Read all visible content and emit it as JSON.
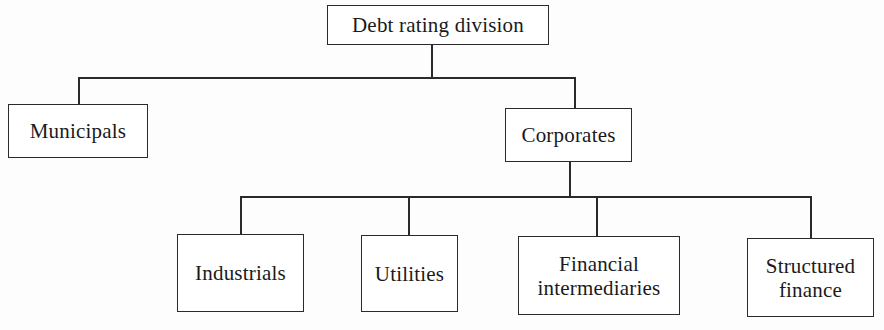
{
  "diagram": {
    "type": "org-chart",
    "root": {
      "label": "Debt rating division",
      "children": [
        {
          "label": "Municipals",
          "children": []
        },
        {
          "label": "Corporates",
          "children": [
            {
              "label": "Industrials"
            },
            {
              "label": "Utilities"
            },
            {
              "label": "Financial intermediaries",
              "lines": [
                "Financial",
                "intermediaries"
              ]
            },
            {
              "label": "Structured finance",
              "lines": [
                "Structured",
                "finance"
              ]
            }
          ]
        }
      ]
    }
  },
  "nodes": {
    "root": {
      "label": "Debt rating division"
    },
    "municipals": {
      "label": "Municipals"
    },
    "corporates": {
      "label": "Corporates"
    },
    "industrials": {
      "label": "Industrials"
    },
    "utilities": {
      "label": "Utilities"
    },
    "financial": {
      "line1": "Financial",
      "line2": "intermediaries"
    },
    "structured": {
      "line1": "Structured",
      "line2": "finance"
    }
  },
  "style": {
    "line_color": "#2a2a2a",
    "background": "#fdfdfd"
  }
}
